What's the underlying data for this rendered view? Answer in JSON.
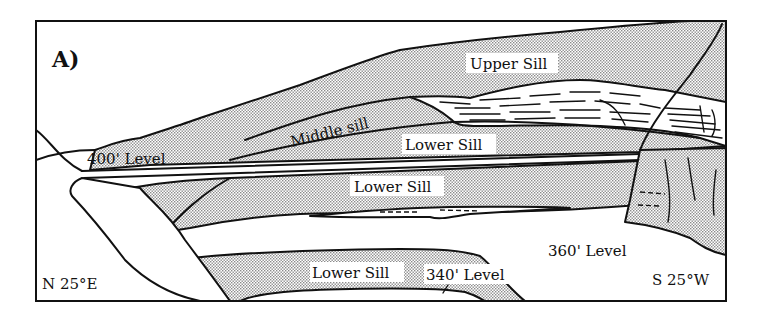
{
  "figure": {
    "panel_label": "A)",
    "orientation_left": "N 25°E",
    "orientation_right": "S 25°W",
    "labels": {
      "upper_sill": "Upper Sill",
      "middle_sill": "Middle sill",
      "lower_sill_upper": "Lower Sill",
      "lower_sill_middle": "Lower Sill",
      "lower_sill_bottom": "Lower Sill",
      "level_400": "400' Level",
      "level_360": "360' Level",
      "level_340": "340' Level"
    },
    "colors": {
      "line": "#111111",
      "sill_fill_pattern": "#c8c8c8",
      "background": "#ffffff"
    }
  }
}
